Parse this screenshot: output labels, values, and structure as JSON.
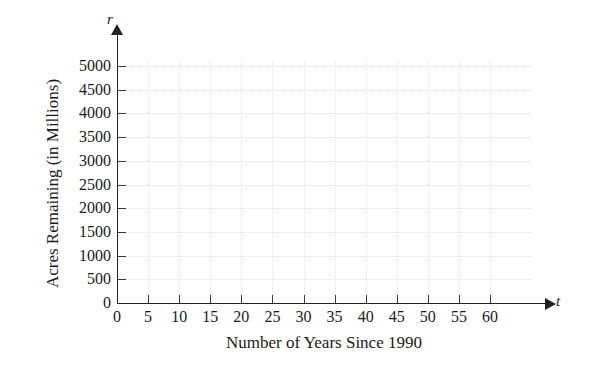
{
  "chart_data": {
    "type": "line",
    "title": "",
    "subtitle": "",
    "xlabel": "Number of Years Since 1990",
    "ylabel": "Acres Remaining (in Millions)",
    "x_variable": "t",
    "y_variable": "r",
    "xlim": [
      0,
      60
    ],
    "ylim": [
      0,
      5000
    ],
    "x_ticks": [
      0,
      5,
      10,
      15,
      20,
      25,
      30,
      35,
      40,
      45,
      50,
      55,
      60
    ],
    "y_ticks": [
      0,
      500,
      1000,
      1500,
      2000,
      2500,
      3000,
      3500,
      4000,
      4500,
      5000
    ],
    "x_tick_labels": [
      "0",
      "5",
      "10",
      "15",
      "20",
      "25",
      "30",
      "35",
      "40",
      "45",
      "50",
      "55",
      "60"
    ],
    "y_tick_labels": [
      "0",
      "500",
      "1000",
      "1500",
      "2000",
      "2500",
      "3000",
      "3500",
      "4000",
      "4500",
      "5000"
    ],
    "x_tick_interval": 5,
    "y_tick_interval": 500,
    "grid": true,
    "grid_style": "dotted",
    "grid_color": "#e2e2e2",
    "legend": false,
    "legend_position": "none",
    "series": [],
    "annotations": [],
    "axis_color": "#222222",
    "axis_arrows": true,
    "plot_background": "#ffffff",
    "note": "Empty coordinate grid with no plotted data — blank graph template for student work"
  },
  "axes": {
    "x_variable_label": "t",
    "y_variable_label": "r",
    "x_title": "Number of Years Since 1990",
    "y_title": "Acres Remaining (in Millions)"
  }
}
